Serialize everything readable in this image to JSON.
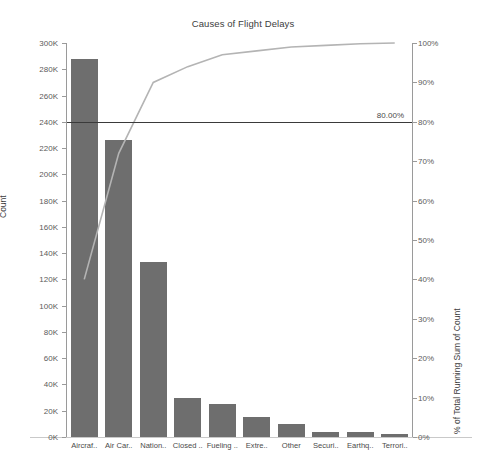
{
  "chart_data": {
    "type": "bar",
    "title": "Causes of Flight Delays",
    "xlabel": "",
    "ylabel": "Count",
    "y2label": "% of Total Running Sum of Count",
    "ylim": [
      0,
      300000
    ],
    "y2lim": [
      0,
      100
    ],
    "grid": false,
    "legend": "none",
    "categories": [
      "Aircraf..",
      "Air Car..",
      "Nation..",
      "Closed ..",
      "Fueling ..",
      "Extre..",
      "Other",
      "Securi..",
      "Earthq..",
      "Terrori.."
    ],
    "values": [
      288000,
      226000,
      133000,
      30000,
      25000,
      15000,
      10000,
      4000,
      4000,
      2000
    ],
    "series": [
      {
        "name": "Count",
        "type": "bar",
        "axis": "left",
        "values": [
          288000,
          226000,
          133000,
          30000,
          25000,
          15000,
          10000,
          4000,
          4000,
          2000
        ]
      },
      {
        "name": "% of Total Running Sum of Count",
        "type": "line",
        "axis": "right",
        "values": [
          40,
          72,
          90,
          94,
          97,
          98,
          99,
          99.4,
          99.8,
          100
        ]
      }
    ],
    "yticks": [
      "0K",
      "20K",
      "40K",
      "60K",
      "80K",
      "100K",
      "120K",
      "140K",
      "160K",
      "180K",
      "200K",
      "220K",
      "240K",
      "260K",
      "280K",
      "300K"
    ],
    "ytick_values": [
      0,
      20000,
      40000,
      60000,
      80000,
      100000,
      120000,
      140000,
      160000,
      180000,
      200000,
      220000,
      240000,
      260000,
      280000,
      300000
    ],
    "y2ticks": [
      "0%",
      "10%",
      "20%",
      "30%",
      "40%",
      "50%",
      "60%",
      "70%",
      "80%",
      "90%",
      "100%"
    ],
    "y2tick_values": [
      0,
      10,
      20,
      30,
      40,
      50,
      60,
      70,
      80,
      90,
      100
    ],
    "reference_line": {
      "label": "80.00%",
      "value": 80,
      "axis": "right"
    },
    "colors": {
      "bar": "#6e6e6e",
      "line": "#b4b4b4",
      "reference_line": "#3a3a3a",
      "axis": "#9a9a9a",
      "text": "#4a4a4a",
      "background": "#ffffff"
    }
  }
}
